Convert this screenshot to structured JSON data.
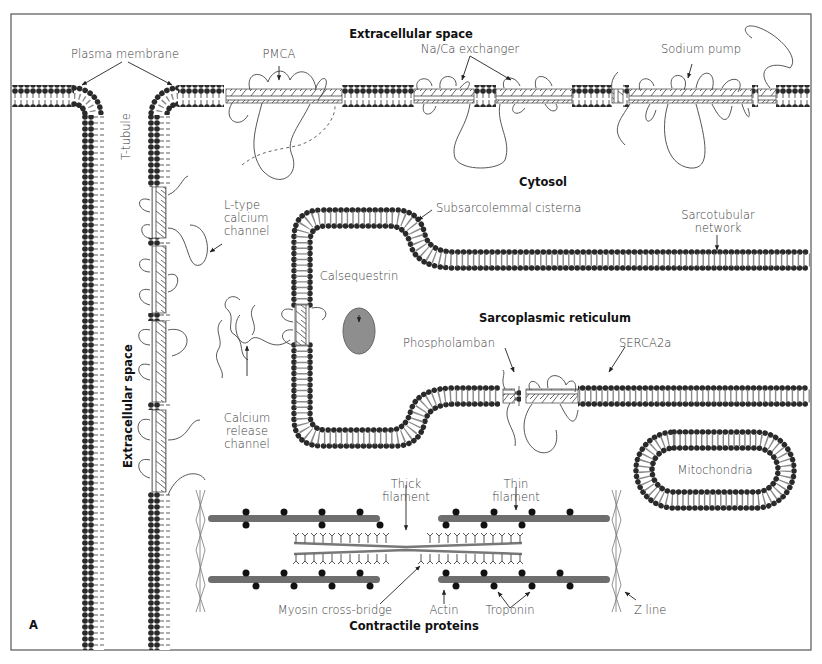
{
  "figure": {
    "panel_letter": "A",
    "regions": {
      "extracellular_top": "Extracellular space",
      "extracellular_left": "Extracellular space",
      "cytosol": "Cytosol",
      "sarcoplasmic_reticulum": "Sarcoplasmic reticulum",
      "contractile_proteins": "Contractile proteins"
    },
    "labels": {
      "plasma_membrane": "Plasma membrane",
      "t_tubule": "T-tubule",
      "pmca": "PMCA",
      "na_ca_exchanger": "Na/Ca exchanger",
      "sodium_pump": "Sodium pump",
      "l_type_channel": "L-type\ncalcium\nchannel",
      "subsarcolemmal_cisterna": "Subsarcolemmal cisterna",
      "sarcotubular_network": "Sarcotubular\nnetwork",
      "calsequestrin": "Calsequestrin",
      "calcium_release_channel": "Calcium\nrelease\nchannel",
      "phospholamban": "Phospholamban",
      "serca2a": "SERCA2a",
      "mitochondria": "Mitochondria",
      "thick_filament": "Thick\nfilament",
      "thin_filament": "Thin\nfilament",
      "myosin_cross_bridge": "Myosin cross-bridge",
      "actin": "Actin",
      "troponin": "Troponin",
      "z_line": "Z line"
    },
    "colors": {
      "lipid_head": "#2a2a2a",
      "lipid_tail": "#8a8a8a",
      "protein_stroke": "#444444",
      "calsequestrin_fill": "#8e8e8e",
      "actin_fill": "#6e6e6e",
      "frame": "#555555"
    }
  }
}
